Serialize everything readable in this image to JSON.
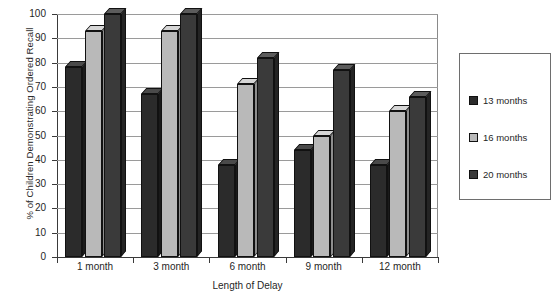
{
  "chart_data": {
    "type": "bar",
    "title": "",
    "xlabel": "Length of Delay",
    "ylabel": "% of Children Demonstrating Ordered Recall",
    "categories": [
      "1 month",
      "3 month",
      "6 month",
      "9 month",
      "12 month"
    ],
    "series": [
      {
        "name": "13 months",
        "color": "#2b2b2b",
        "values": [
          78,
          67,
          38,
          44,
          38
        ]
      },
      {
        "name": "16 months",
        "color": "#b9b9b9",
        "values": [
          93,
          93,
          71,
          50,
          60
        ]
      },
      {
        "name": "20 months",
        "color": "#3a3a3a",
        "values": [
          100,
          100,
          82,
          77,
          66
        ]
      }
    ],
    "ylim": [
      0,
      100
    ],
    "yticks": [
      0,
      10,
      20,
      30,
      40,
      50,
      60,
      70,
      80,
      90,
      100
    ],
    "ytick_labels": [
      "0",
      "10",
      "20",
      "30",
      "40",
      "50",
      "60",
      "70",
      "80",
      "90",
      "100"
    ],
    "grid": true,
    "legend_position": "right",
    "style": "3d-column-grayscale"
  },
  "legend": {
    "entries": [
      {
        "label": "13 months",
        "color": "#2b2b2b"
      },
      {
        "label": "16 months",
        "color": "#b9b9b9"
      },
      {
        "label": "20 months",
        "color": "#3a3a3a"
      }
    ]
  }
}
